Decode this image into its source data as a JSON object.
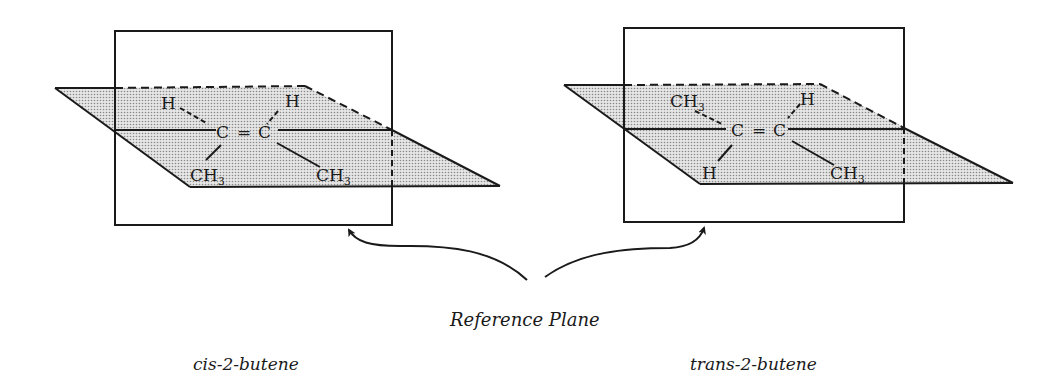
{
  "figure": {
    "reference_label": "Reference Plane",
    "colors": {
      "line": "#1a1a1a",
      "plane_fill": "#d9d9d9",
      "dot": "#8a8a8a",
      "background": "#ffffff"
    }
  },
  "molecules": [
    {
      "name": "cis-2-butene",
      "carbon_left": "C",
      "double_bond": "=",
      "carbon_right": "C",
      "top_left": "H",
      "top_right": "H",
      "bottom_left": {
        "main": "CH",
        "sub": "3"
      },
      "bottom_right": {
        "main": "CH",
        "sub": "3"
      }
    },
    {
      "name": "trans-2-butene",
      "carbon_left": "C",
      "double_bond": "=",
      "carbon_right": "C",
      "top_left": {
        "main": "CH",
        "sub": "3"
      },
      "top_right": "H",
      "bottom_left": "H",
      "bottom_right": {
        "main": "CH",
        "sub": "3"
      }
    }
  ]
}
